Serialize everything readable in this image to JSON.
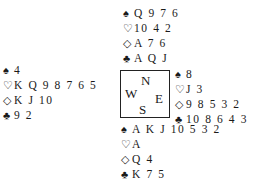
{
  "suit_symbols": {
    "spades": "♠",
    "hearts": "♡",
    "diamonds": "◇",
    "clubs": "♣"
  },
  "compass": {
    "north": "N",
    "south": "S",
    "east": "E",
    "west": "W"
  },
  "hands": {
    "north": {
      "spades": "Q 9 7 6",
      "hearts": "10 4 2",
      "diamonds": "A 7 6",
      "clubs": "A Q J"
    },
    "west": {
      "spades": "4",
      "hearts": "K Q 9 8 7 6 5",
      "diamonds": "K J 10",
      "clubs": "9 2"
    },
    "east": {
      "spades": "8",
      "hearts": "J 3",
      "diamonds": "9 8 5 3 2",
      "clubs": "10 8 6 4 3"
    },
    "south": {
      "spades": "A K J 10 5 3 2",
      "hearts": "A",
      "diamonds": "Q 4",
      "clubs": "K 7 5"
    }
  }
}
